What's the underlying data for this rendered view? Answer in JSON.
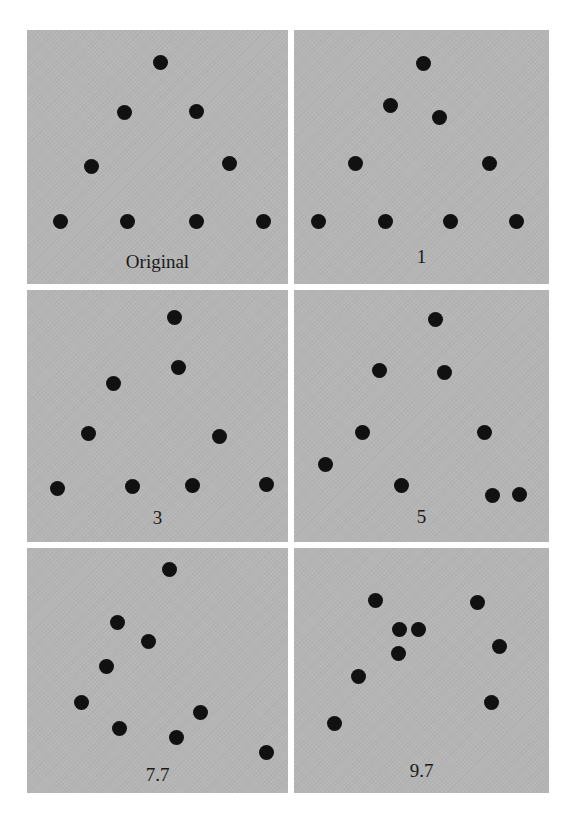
{
  "figure": {
    "background": "#ffffff",
    "panel_color": "#b5b5b5",
    "dot_color": "#111111",
    "panels": [
      {
        "id": "original",
        "label": "Original",
        "box": {
          "x": 27,
          "y": 30,
          "w": 261,
          "h": 254
        },
        "label_y": 252,
        "points": [
          [
            160,
            62
          ],
          [
            124,
            112
          ],
          [
            196,
            111
          ],
          [
            91,
            166
          ],
          [
            229,
            163
          ],
          [
            60,
            221
          ],
          [
            127,
            221
          ],
          [
            196,
            221
          ],
          [
            263,
            221
          ]
        ]
      },
      {
        "id": "1",
        "label": "1",
        "box": {
          "x": 294,
          "y": 30,
          "w": 255,
          "h": 254
        },
        "label_y": 247,
        "points": [
          [
            423,
            63
          ],
          [
            390,
            105
          ],
          [
            439,
            117
          ],
          [
            355,
            163
          ],
          [
            489,
            163
          ],
          [
            318,
            221
          ],
          [
            385,
            221
          ],
          [
            450,
            221
          ],
          [
            516,
            221
          ]
        ]
      },
      {
        "id": "3",
        "label": "3",
        "box": {
          "x": 27,
          "y": 290,
          "w": 261,
          "h": 252
        },
        "label_y": 508,
        "points": [
          [
            174,
            317
          ],
          [
            178,
            367
          ],
          [
            113,
            383
          ],
          [
            88,
            433
          ],
          [
            219,
            436
          ],
          [
            57,
            488
          ],
          [
            132,
            486
          ],
          [
            192,
            485
          ],
          [
            266,
            484
          ]
        ]
      },
      {
        "id": "5",
        "label": "5",
        "box": {
          "x": 294,
          "y": 290,
          "w": 255,
          "h": 252
        },
        "label_y": 507,
        "points": [
          [
            435,
            319
          ],
          [
            379,
            370
          ],
          [
            444,
            372
          ],
          [
            362,
            432
          ],
          [
            484,
            432
          ],
          [
            325,
            464
          ],
          [
            401,
            485
          ],
          [
            492,
            495
          ],
          [
            519,
            494
          ]
        ]
      },
      {
        "id": "7.7",
        "label": "7.7",
        "box": {
          "x": 27,
          "y": 548,
          "w": 261,
          "h": 245
        },
        "label_y": 765,
        "points": [
          [
            169,
            569
          ],
          [
            117,
            622
          ],
          [
            148,
            641
          ],
          [
            106,
            666
          ],
          [
            81,
            702
          ],
          [
            119,
            728
          ],
          [
            176,
            737
          ],
          [
            200,
            712
          ],
          [
            266,
            752
          ]
        ]
      },
      {
        "id": "9.7",
        "label": "9.7",
        "box": {
          "x": 294,
          "y": 548,
          "w": 255,
          "h": 245
        },
        "label_y": 761,
        "points": [
          [
            375,
            600
          ],
          [
            399,
            629
          ],
          [
            418,
            629
          ],
          [
            398,
            653
          ],
          [
            477,
            602
          ],
          [
            499,
            646
          ],
          [
            358,
            676
          ],
          [
            491,
            702
          ],
          [
            334,
            723
          ]
        ]
      }
    ]
  }
}
